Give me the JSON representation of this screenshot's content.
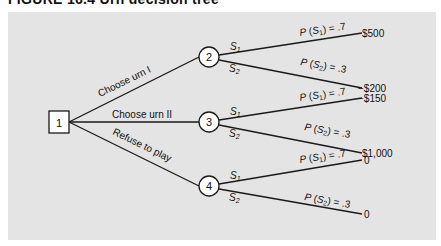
{
  "figure": {
    "title": "FIGURE 16.4  Urn decision tree",
    "background_color": "#e4e4e4",
    "line_color": "#1a1a1a"
  },
  "nodes": {
    "n1": {
      "label": "1",
      "type": "decision"
    },
    "n2": {
      "label": "2",
      "type": "chance"
    },
    "n3": {
      "label": "3",
      "type": "chance"
    },
    "n4": {
      "label": "4",
      "type": "chance"
    }
  },
  "decisions": [
    {
      "label": "Choose urn I",
      "to": "2"
    },
    {
      "label": "Choose urn II",
      "to": "3"
    },
    {
      "label": "Refuse to play",
      "to": "4"
    }
  ],
  "branches": {
    "n2_s1": {
      "state": "S1",
      "prob": "P(S1) = .7",
      "payoff": "$500"
    },
    "n2_s2": {
      "state": "S2",
      "prob": "P(S2) = .3",
      "payoff": "−$200"
    },
    "n3_s1": {
      "state": "S1",
      "prob": "P(S1) = .7",
      "payoff": "−$150"
    },
    "n3_s2": {
      "state": "S2",
      "prob": "P(S2) = .3",
      "payoff": "$1,000"
    },
    "n4_s1": {
      "state": "S1",
      "prob": "P(S1) = .7",
      "payoff": "0"
    },
    "n4_s2": {
      "state": "S2",
      "prob": "P(S2) = .3",
      "payoff": "0"
    }
  }
}
